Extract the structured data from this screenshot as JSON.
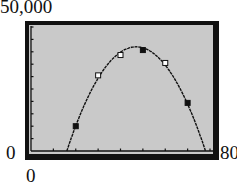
{
  "window": {
    "ymax_label": "50,000",
    "ymin_label": "0",
    "xmin_label": "0",
    "xmax_label": "80"
  },
  "colors": {
    "screen": "#c9c9c9",
    "frame": "#111111",
    "curve": "#111111"
  },
  "chart_data": {
    "type": "scatter",
    "title": "",
    "xlabel": "",
    "ylabel": "",
    "xlim": [
      0,
      80
    ],
    "ylim": [
      0,
      50000
    ],
    "xscale_tick": 10,
    "yscale_tick": 5000,
    "grid": false,
    "legend": null,
    "series": [
      {
        "name": "data points",
        "x": [
          20,
          30,
          40,
          50,
          60,
          70
        ],
        "y": [
          10000,
          30500,
          38700,
          40700,
          35500,
          19400
        ],
        "markers": [
          "filled-square",
          "open-square",
          "open-square",
          "filled-square",
          "open-square",
          "filled-square"
        ]
      },
      {
        "name": "quadratic model",
        "type": "line",
        "description": "downward-opening parabola",
        "roots": [
          16,
          78
        ],
        "vertex": [
          47,
          42000
        ]
      }
    ]
  }
}
